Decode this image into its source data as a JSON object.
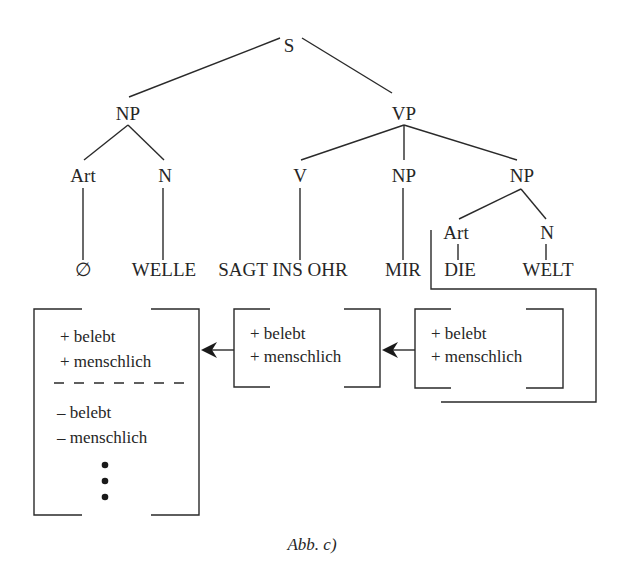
{
  "tree": {
    "root": "S",
    "nodes": {
      "s": "S",
      "np_subject": "NP",
      "vp": "VP",
      "art_subject": "Art",
      "n_subject": "N",
      "v": "V",
      "np_indirect": "NP",
      "np_object": "NP",
      "art_object": "Art",
      "n_object": "N"
    },
    "leaves": {
      "art_subject": "∅",
      "n_subject": "WELLE",
      "v": "SAGT INS OHR",
      "np_indirect": "MIR",
      "art_object": "DIE",
      "n_object": "WELT"
    }
  },
  "feature_boxes": [
    {
      "id": "subject-features",
      "lines": [
        "+ belebt",
        "+ menschlich"
      ],
      "separator": "dashed",
      "lines_after_separator": [
        "– belebt",
        "– menschlich"
      ],
      "continuation": "⋮"
    },
    {
      "id": "indirect-object-features",
      "lines": [
        "+ belebt",
        "+ menschlich"
      ]
    },
    {
      "id": "object-features",
      "lines": [
        "+ belebt",
        "+ menschlich"
      ]
    }
  ],
  "arrows": [
    {
      "from": "object-features",
      "to": "indirect-object-features"
    },
    {
      "from": "indirect-object-features",
      "to": "subject-features"
    }
  ],
  "caption": "Abb. c)"
}
